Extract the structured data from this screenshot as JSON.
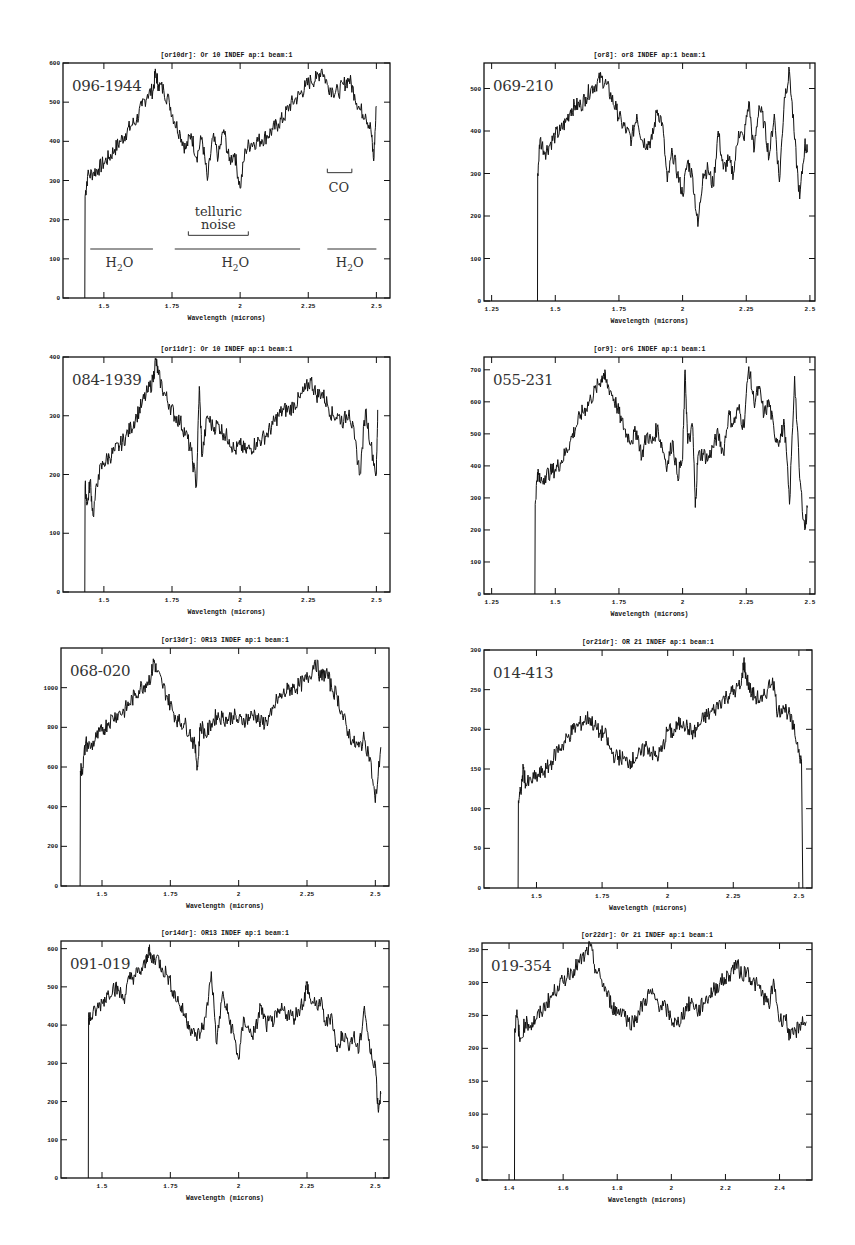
{
  "chart_data": [
    {
      "type": "line",
      "panel_id": "p1",
      "title": "[or10dr]: Or 10 INDEF ap:1 beam:1",
      "object_label": "096-1944",
      "xlabel": "Wavelength (microns)",
      "ylabel": "",
      "xlim": [
        1.35,
        2.55
      ],
      "ylim": [
        0,
        600
      ],
      "xticks": [
        1.5,
        1.75,
        2,
        2.25,
        2.5
      ],
      "xtick_labels": [
        "1.5",
        "1.75",
        "2",
        "2.25",
        "2.5"
      ],
      "yticks": [
        0,
        100,
        200,
        300,
        400,
        500,
        600
      ],
      "frame": {
        "left": 63,
        "top": 63,
        "right": 390,
        "bottom": 298
      },
      "x": [
        1.43,
        1.431,
        1.44,
        1.46,
        1.48,
        1.5,
        1.52,
        1.54,
        1.56,
        1.58,
        1.6,
        1.62,
        1.64,
        1.66,
        1.68,
        1.69,
        1.7,
        1.72,
        1.74,
        1.76,
        1.78,
        1.8,
        1.82,
        1.84,
        1.86,
        1.88,
        1.9,
        1.92,
        1.94,
        1.96,
        1.98,
        2.0,
        2.02,
        2.04,
        2.06,
        2.08,
        2.1,
        2.12,
        2.14,
        2.16,
        2.18,
        2.2,
        2.22,
        2.24,
        2.26,
        2.28,
        2.3,
        2.32,
        2.34,
        2.36,
        2.38,
        2.4,
        2.42,
        2.44,
        2.46,
        2.48,
        2.49,
        2.5
      ],
      "values": [
        0,
        260,
        310,
        320,
        330,
        345,
        360,
        380,
        400,
        420,
        440,
        455,
        490,
        520,
        530,
        575,
        545,
        530,
        500,
        450,
        420,
        380,
        420,
        360,
        410,
        300,
        410,
        360,
        430,
        350,
        370,
        280,
        380,
        395,
        400,
        405,
        415,
        430,
        445,
        460,
        490,
        505,
        520,
        540,
        555,
        560,
        585,
        545,
        530,
        525,
        545,
        560,
        520,
        480,
        470,
        430,
        350,
        490
      ],
      "annotations": [
        {
          "text": "H2O",
          "band": [
            1.45,
            1.68
          ],
          "y": 125
        },
        {
          "text": "H2O",
          "band": [
            1.76,
            2.22
          ],
          "y": 125
        },
        {
          "text": "H2O",
          "band": [
            2.32,
            2.5
          ],
          "y": 125
        },
        {
          "text": "telluric noise",
          "band": [
            1.81,
            2.03
          ],
          "y": 160
        },
        {
          "text": "CO",
          "band": [
            2.32,
            2.41
          ],
          "y": 320
        }
      ]
    },
    {
      "type": "line",
      "panel_id": "p2",
      "title": "[or8]: or8 INDEF ap:1 beam:1",
      "object_label": "069-210",
      "xlabel": "Wavelength (microns)",
      "ylabel": "",
      "xlim": [
        1.22,
        2.52
      ],
      "ylim": [
        0,
        560
      ],
      "xticks": [
        1.25,
        1.5,
        1.75,
        2,
        2.25,
        2.5
      ],
      "xtick_labels": [
        "1.25",
        "1.5",
        "1.75",
        "2",
        "2.25",
        "2.5"
      ],
      "yticks": [
        0,
        100,
        200,
        300,
        400,
        500
      ],
      "frame": {
        "left": 484,
        "top": 63,
        "right": 815,
        "bottom": 301
      },
      "x": [
        1.43,
        1.431,
        1.44,
        1.46,
        1.48,
        1.5,
        1.52,
        1.54,
        1.56,
        1.58,
        1.6,
        1.62,
        1.64,
        1.66,
        1.68,
        1.7,
        1.72,
        1.74,
        1.76,
        1.78,
        1.8,
        1.82,
        1.84,
        1.86,
        1.88,
        1.9,
        1.92,
        1.94,
        1.96,
        1.98,
        2.0,
        2.02,
        2.04,
        2.06,
        2.08,
        2.1,
        2.12,
        2.14,
        2.16,
        2.18,
        2.2,
        2.22,
        2.24,
        2.26,
        2.28,
        2.3,
        2.32,
        2.34,
        2.36,
        2.38,
        2.4,
        2.42,
        2.44,
        2.46,
        2.48,
        2.49
      ],
      "values": [
        0,
        300,
        380,
        350,
        370,
        390,
        400,
        420,
        450,
        460,
        460,
        480,
        500,
        510,
        525,
        510,
        480,
        450,
        420,
        400,
        380,
        440,
        380,
        370,
        380,
        450,
        420,
        280,
        350,
        300,
        250,
        330,
        290,
        175,
        300,
        310,
        270,
        400,
        310,
        330,
        300,
        400,
        380,
        470,
        350,
        460,
        420,
        340,
        440,
        280,
        480,
        540,
        380,
        240,
        370,
        350
      ],
      "annotations": []
    },
    {
      "type": "line",
      "panel_id": "p3",
      "title": "[or11dr]: Or 10 INDEF ap:1 beam:1",
      "object_label": "084-1939",
      "xlabel": "Wavelength (microns)",
      "ylabel": "",
      "xlim": [
        1.35,
        2.55
      ],
      "ylim": [
        0,
        400
      ],
      "xticks": [
        1.5,
        1.75,
        2,
        2.25,
        2.5
      ],
      "xtick_labels": [
        "1.5",
        "1.75",
        "2",
        "2.25",
        "2.5"
      ],
      "yticks": [
        0,
        100,
        200,
        300,
        400
      ],
      "frame": {
        "left": 63,
        "top": 357,
        "right": 390,
        "bottom": 592
      },
      "x": [
        1.43,
        1.431,
        1.44,
        1.45,
        1.46,
        1.48,
        1.5,
        1.52,
        1.54,
        1.56,
        1.58,
        1.6,
        1.62,
        1.64,
        1.66,
        1.68,
        1.69,
        1.7,
        1.72,
        1.74,
        1.76,
        1.78,
        1.8,
        1.82,
        1.84,
        1.85,
        1.86,
        1.88,
        1.9,
        1.92,
        1.94,
        1.96,
        1.98,
        2.0,
        2.02,
        2.04,
        2.06,
        2.08,
        2.1,
        2.12,
        2.14,
        2.16,
        2.18,
        2.2,
        2.22,
        2.24,
        2.26,
        2.28,
        2.3,
        2.32,
        2.34,
        2.36,
        2.38,
        2.4,
        2.42,
        2.44,
        2.46,
        2.48,
        2.5,
        2.505
      ],
      "values": [
        0,
        180,
        150,
        190,
        130,
        200,
        220,
        230,
        240,
        250,
        265,
        280,
        300,
        320,
        340,
        360,
        395,
        370,
        340,
        320,
        300,
        290,
        270,
        240,
        180,
        350,
        230,
        300,
        280,
        285,
        270,
        260,
        240,
        250,
        240,
        245,
        255,
        260,
        270,
        285,
        300,
        310,
        310,
        320,
        330,
        345,
        360,
        335,
        340,
        320,
        300,
        300,
        290,
        310,
        260,
        200,
        310,
        250,
        200,
        310
      ],
      "annotations": []
    },
    {
      "type": "line",
      "panel_id": "p4",
      "title": "[or9]: or6 INDEF ap:1 beam:1",
      "object_label": "055-231",
      "xlabel": "Wavelength (microns)",
      "ylabel": "",
      "xlim": [
        1.22,
        2.52
      ],
      "ylim": [
        0,
        740
      ],
      "xticks": [
        1.25,
        1.5,
        1.75,
        2,
        2.25,
        2.5
      ],
      "xtick_labels": [
        "1.25",
        "1.5",
        "1.75",
        "2",
        "2.25",
        "2.5"
      ],
      "yticks": [
        0,
        100,
        200,
        300,
        400,
        500,
        600,
        700
      ],
      "frame": {
        "left": 484,
        "top": 357,
        "right": 815,
        "bottom": 594
      },
      "x": [
        1.42,
        1.421,
        1.43,
        1.44,
        1.46,
        1.48,
        1.5,
        1.52,
        1.54,
        1.56,
        1.58,
        1.6,
        1.62,
        1.64,
        1.66,
        1.68,
        1.69,
        1.7,
        1.72,
        1.74,
        1.76,
        1.78,
        1.8,
        1.82,
        1.84,
        1.86,
        1.88,
        1.9,
        1.92,
        1.94,
        1.96,
        1.98,
        2.0,
        2.01,
        2.02,
        2.04,
        2.05,
        2.06,
        2.08,
        2.1,
        2.12,
        2.14,
        2.16,
        2.18,
        2.2,
        2.22,
        2.24,
        2.26,
        2.28,
        2.3,
        2.32,
        2.34,
        2.36,
        2.38,
        2.4,
        2.42,
        2.44,
        2.46,
        2.48,
        2.49
      ],
      "values": [
        0,
        280,
        380,
        350,
        370,
        380,
        390,
        410,
        440,
        480,
        520,
        560,
        580,
        610,
        640,
        670,
        690,
        660,
        630,
        590,
        540,
        500,
        480,
        510,
        430,
        500,
        470,
        520,
        460,
        400,
        480,
        370,
        420,
        700,
        470,
        520,
        270,
        430,
        440,
        420,
        460,
        500,
        440,
        560,
        530,
        580,
        520,
        710,
        600,
        640,
        560,
        600,
        500,
        480,
        530,
        280,
        680,
        360,
        200,
        270
      ],
      "annotations": []
    },
    {
      "type": "line",
      "panel_id": "p5",
      "title": "[or13dr]: OR13 INDEF ap:1 beam:1",
      "object_label": "068-020",
      "xlabel": "Wavelength (microns)",
      "ylabel": "",
      "xlim": [
        1.35,
        2.55
      ],
      "ylim": [
        0,
        1200
      ],
      "xticks": [
        1.5,
        1.75,
        2,
        2.25,
        2.5
      ],
      "xtick_labels": [
        "1.5",
        "1.75",
        "2",
        "2.25",
        "2.5"
      ],
      "yticks": [
        0,
        200,
        400,
        600,
        800,
        1000
      ],
      "frame": {
        "left": 61,
        "top": 648,
        "right": 389,
        "bottom": 886
      },
      "x": [
        1.42,
        1.421,
        1.43,
        1.44,
        1.46,
        1.48,
        1.5,
        1.52,
        1.54,
        1.56,
        1.58,
        1.6,
        1.62,
        1.64,
        1.66,
        1.68,
        1.69,
        1.7,
        1.72,
        1.74,
        1.76,
        1.78,
        1.8,
        1.82,
        1.84,
        1.85,
        1.86,
        1.88,
        1.9,
        1.92,
        1.94,
        1.96,
        1.98,
        2.0,
        2.02,
        2.04,
        2.06,
        2.08,
        2.1,
        2.12,
        2.14,
        2.16,
        2.18,
        2.2,
        2.22,
        2.24,
        2.26,
        2.28,
        2.3,
        2.32,
        2.34,
        2.36,
        2.38,
        2.4,
        2.42,
        2.44,
        2.46,
        2.48,
        2.5,
        2.52
      ],
      "values": [
        0,
        580,
        600,
        720,
        700,
        750,
        780,
        820,
        850,
        870,
        880,
        920,
        960,
        1000,
        1020,
        1060,
        1140,
        1080,
        1020,
        950,
        880,
        830,
        820,
        780,
        700,
        600,
        820,
        760,
        820,
        860,
        850,
        840,
        860,
        830,
        840,
        850,
        870,
        820,
        830,
        860,
        940,
        960,
        990,
        1000,
        1010,
        1030,
        1060,
        1140,
        1050,
        1080,
        1000,
        960,
        860,
        780,
        720,
        700,
        740,
        650,
        420,
        700
      ],
      "annotations": []
    },
    {
      "type": "line",
      "panel_id": "p6",
      "title": "[or21dr]: OR 21 INDEF ap:1 beam:1",
      "object_label": "014-413",
      "xlabel": "Wavelength (microns)",
      "ylabel": "",
      "xlim": [
        1.3,
        2.55
      ],
      "ylim": [
        0,
        300
      ],
      "xticks": [
        1.5,
        1.75,
        2,
        2.25,
        2.5
      ],
      "xtick_labels": [
        "1.5",
        "1.75",
        "2",
        "2.25",
        "2.5"
      ],
      "yticks": [
        0,
        50,
        100,
        150,
        200,
        250,
        300
      ],
      "frame": {
        "left": 484,
        "top": 650,
        "right": 812,
        "bottom": 888
      },
      "x": [
        1.43,
        1.431,
        1.44,
        1.45,
        1.46,
        1.48,
        1.5,
        1.52,
        1.54,
        1.56,
        1.58,
        1.6,
        1.62,
        1.64,
        1.66,
        1.68,
        1.7,
        1.72,
        1.74,
        1.76,
        1.78,
        1.8,
        1.82,
        1.84,
        1.86,
        1.88,
        1.9,
        1.92,
        1.94,
        1.96,
        1.98,
        2.0,
        2.02,
        2.04,
        2.06,
        2.08,
        2.1,
        2.12,
        2.14,
        2.16,
        2.18,
        2.2,
        2.22,
        2.24,
        2.26,
        2.28,
        2.29,
        2.3,
        2.32,
        2.34,
        2.36,
        2.38,
        2.4,
        2.42,
        2.44,
        2.46,
        2.48,
        2.5,
        2.51,
        2.515
      ],
      "values": [
        0,
        110,
        120,
        150,
        130,
        135,
        140,
        145,
        150,
        160,
        175,
        180,
        190,
        200,
        205,
        210,
        215,
        205,
        195,
        195,
        175,
        165,
        165,
        160,
        160,
        165,
        170,
        180,
        170,
        165,
        175,
        200,
        195,
        205,
        210,
        200,
        195,
        205,
        215,
        220,
        225,
        235,
        240,
        245,
        250,
        255,
        285,
        265,
        245,
        240,
        235,
        250,
        265,
        220,
        230,
        220,
        200,
        175,
        160,
        0
      ],
      "annotations": []
    },
    {
      "type": "line",
      "panel_id": "p7",
      "title": "[or14dr]: OR13 INDEF ap:1 beam:1",
      "object_label": "091-019",
      "xlabel": "Wavelength (microns)",
      "ylabel": "",
      "xlim": [
        1.35,
        2.55
      ],
      "ylim": [
        0,
        620
      ],
      "xticks": [
        1.5,
        1.75,
        2,
        2.25,
        2.5
      ],
      "xtick_labels": [
        "1.5",
        "1.75",
        "2",
        "2.25",
        "2.5"
      ],
      "yticks": [
        0,
        100,
        200,
        300,
        400,
        500,
        600
      ],
      "frame": {
        "left": 61,
        "top": 941,
        "right": 389,
        "bottom": 1178
      },
      "x": [
        1.45,
        1.451,
        1.46,
        1.48,
        1.5,
        1.52,
        1.54,
        1.56,
        1.58,
        1.6,
        1.62,
        1.64,
        1.66,
        1.67,
        1.68,
        1.7,
        1.72,
        1.74,
        1.76,
        1.78,
        1.8,
        1.82,
        1.84,
        1.86,
        1.88,
        1.9,
        1.92,
        1.94,
        1.96,
        1.98,
        2.0,
        2.02,
        2.04,
        2.06,
        2.08,
        2.1,
        2.12,
        2.14,
        2.16,
        2.18,
        2.2,
        2.22,
        2.24,
        2.25,
        2.26,
        2.28,
        2.3,
        2.32,
        2.34,
        2.36,
        2.38,
        2.4,
        2.42,
        2.44,
        2.46,
        2.48,
        2.5,
        2.51,
        2.52
      ],
      "values": [
        0,
        420,
        420,
        440,
        460,
        480,
        500,
        490,
        470,
        520,
        530,
        540,
        560,
        600,
        570,
        580,
        550,
        530,
        490,
        460,
        430,
        400,
        370,
        380,
        420,
        540,
        350,
        480,
        430,
        380,
        310,
        420,
        380,
        380,
        450,
        400,
        410,
        420,
        440,
        430,
        420,
        440,
        470,
        510,
        470,
        450,
        460,
        400,
        430,
        330,
        380,
        350,
        370,
        330,
        450,
        330,
        300,
        180,
        220
      ],
      "annotations": []
    },
    {
      "type": "line",
      "panel_id": "p8",
      "title": "[or22dr]: Or 21 INDEF ap:1 beam:1",
      "object_label": "019-354",
      "xlabel": "Wavelength (microns)",
      "ylabel": "",
      "xlim": [
        1.3,
        2.52
      ],
      "ylim": [
        0,
        360
      ],
      "xticks": [
        1.4,
        1.6,
        1.8,
        2,
        2.2,
        2.4
      ],
      "xtick_labels": [
        "1.4",
        "1.6",
        "1.8",
        "2",
        "2.2",
        "2.4"
      ],
      "yticks": [
        0,
        50,
        100,
        150,
        200,
        250,
        300,
        350
      ],
      "frame": {
        "left": 482,
        "top": 943,
        "right": 812,
        "bottom": 1180
      },
      "x": [
        1.42,
        1.421,
        1.43,
        1.44,
        1.46,
        1.48,
        1.5,
        1.52,
        1.54,
        1.56,
        1.58,
        1.6,
        1.62,
        1.64,
        1.66,
        1.68,
        1.7,
        1.72,
        1.74,
        1.76,
        1.78,
        1.8,
        1.82,
        1.84,
        1.86,
        1.88,
        1.9,
        1.92,
        1.94,
        1.96,
        1.98,
        2.0,
        2.02,
        2.04,
        2.06,
        2.08,
        2.1,
        2.12,
        2.14,
        2.16,
        2.18,
        2.2,
        2.22,
        2.24,
        2.26,
        2.28,
        2.3,
        2.32,
        2.34,
        2.36,
        2.38,
        2.4,
        2.42,
        2.44,
        2.46,
        2.48,
        2.5
      ],
      "values": [
        0,
        230,
        250,
        210,
        240,
        235,
        245,
        255,
        270,
        280,
        295,
        300,
        315,
        320,
        330,
        340,
        355,
        320,
        305,
        285,
        265,
        255,
        260,
        240,
        240,
        255,
        270,
        285,
        275,
        265,
        260,
        245,
        235,
        250,
        265,
        270,
        255,
        270,
        280,
        290,
        300,
        305,
        315,
        330,
        310,
        320,
        300,
        295,
        280,
        265,
        300,
        240,
        250,
        215,
        225,
        240,
        240
      ],
      "annotations": []
    }
  ],
  "annotation_text": {
    "h2o_main": "H",
    "h2o_sub": "2",
    "h2o_tail": "O",
    "telluric_line1": "telluric",
    "telluric_line2": "noise",
    "co": "CO"
  }
}
